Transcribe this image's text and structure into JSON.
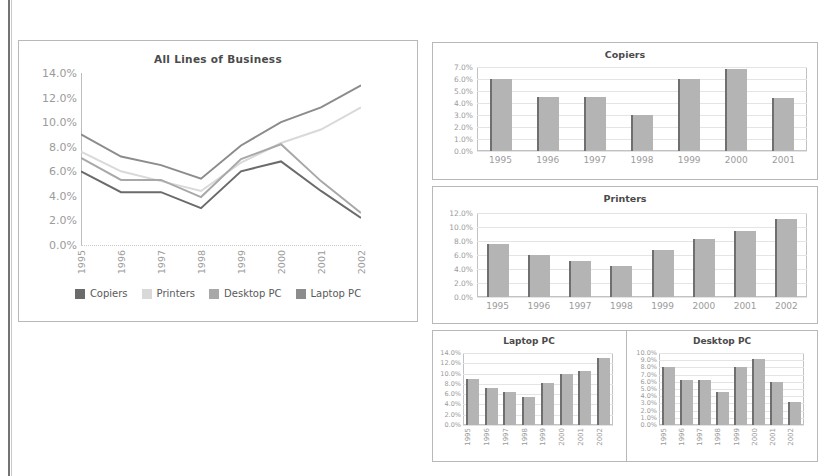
{
  "document": {
    "background_color": "#ffffff",
    "page_edge_color": "#5b5b5b"
  },
  "palette": {
    "copiers": "#6b6b6b",
    "printers": "#d9d9d9",
    "desktop_pc": "#a8a8a8",
    "laptop_pc": "#8c8c8c",
    "bar_fill": "#b4b4b4",
    "bar_edge": "#6f6f6f",
    "grid": "#e4e4e4",
    "axis": "#bdbdbd",
    "panel_border": "#b8b8b8",
    "tick_text": "#9b9b9b",
    "title_text": "#4a4a4a"
  },
  "line_chart": {
    "title": "All Lines of Business",
    "legend": [
      {
        "label": "Copiers",
        "color": "#6b6b6b"
      },
      {
        "label": "Printers",
        "color": "#d9d9d9"
      },
      {
        "label": "Desktop PC",
        "color": "#a8a8a8"
      },
      {
        "label": "Laptop PC",
        "color": "#8c8c8c"
      }
    ]
  },
  "chart_data": [
    {
      "id": "all-lines-of-business",
      "type": "line",
      "title": "All Lines of Business",
      "xlabel": "",
      "ylabel": "",
      "x": [
        "1995",
        "1996",
        "1997",
        "1998",
        "1999",
        "2000",
        "2001",
        "2002"
      ],
      "yticks": [
        "0.0%",
        "2.0%",
        "4.0%",
        "6.0%",
        "8.0%",
        "10.0%",
        "12.0%",
        "14.0%"
      ],
      "ylim": [
        0,
        14
      ],
      "grid": false,
      "legend_position": "bottom",
      "series": [
        {
          "name": "Copiers",
          "color": "#6b6b6b",
          "values": [
            6.0,
            4.3,
            4.3,
            3.0,
            6.0,
            6.8,
            4.4,
            2.2
          ]
        },
        {
          "name": "Printers",
          "color": "#d9d9d9",
          "values": [
            7.6,
            6.0,
            5.2,
            4.4,
            6.7,
            8.3,
            9.4,
            11.2
          ]
        },
        {
          "name": "Desktop PC",
          "color": "#a8a8a8",
          "values": [
            7.1,
            5.3,
            5.3,
            3.9,
            7.0,
            8.2,
            5.2,
            2.6
          ]
        },
        {
          "name": "Laptop PC",
          "color": "#8c8c8c",
          "values": [
            9.0,
            7.2,
            6.5,
            5.4,
            8.1,
            10.0,
            11.2,
            13.0
          ]
        }
      ]
    },
    {
      "id": "copiers",
      "type": "bar",
      "title": "Copiers",
      "xlabel": "",
      "ylabel": "",
      "categories": [
        "1995",
        "1996",
        "1997",
        "1998",
        "1999",
        "2000",
        "2001"
      ],
      "values": [
        6.0,
        4.5,
        4.5,
        3.0,
        6.0,
        6.8,
        4.4
      ],
      "yticks": [
        "0.0%",
        "1.0%",
        "2.0%",
        "3.0%",
        "4.0%",
        "5.0%",
        "6.0%",
        "7.0%"
      ],
      "ylim": [
        0,
        7
      ],
      "grid": true
    },
    {
      "id": "printers",
      "type": "bar",
      "title": "Printers",
      "xlabel": "",
      "ylabel": "",
      "categories": [
        "1995",
        "1996",
        "1997",
        "1998",
        "1999",
        "2000",
        "2001",
        "2002"
      ],
      "values": [
        7.6,
        6.0,
        5.2,
        4.4,
        6.7,
        8.3,
        9.4,
        11.2
      ],
      "yticks": [
        "0.0%",
        "2.0%",
        "4.0%",
        "6.0%",
        "8.0%",
        "10.0%",
        "12.0%"
      ],
      "ylim": [
        0,
        12
      ],
      "grid": true
    },
    {
      "id": "laptop-pc",
      "type": "bar",
      "title": "Laptop PC",
      "xlabel": "",
      "ylabel": "",
      "categories": [
        "1995",
        "1996",
        "1997",
        "1998",
        "1999",
        "2000",
        "2001",
        "2002"
      ],
      "values": [
        9.0,
        7.2,
        6.5,
        5.4,
        8.1,
        10.0,
        10.6,
        13.0
      ],
      "yticks": [
        "0.0%",
        "2.0%",
        "4.0%",
        "6.0%",
        "8.0%",
        "10.0%",
        "12.0%",
        "14.0%"
      ],
      "ylim": [
        0,
        14
      ],
      "grid": true
    },
    {
      "id": "desktop-pc",
      "type": "bar",
      "title": "Desktop PC",
      "xlabel": "",
      "ylabel": "",
      "categories": [
        "1995",
        "1996",
        "1997",
        "1998",
        "1999",
        "2000",
        "2001",
        "2002"
      ],
      "values": [
        8.0,
        6.2,
        6.2,
        4.6,
        8.0,
        9.2,
        6.0,
        3.2
      ],
      "yticks": [
        "0.0%",
        "1.0%",
        "2.0%",
        "3.0%",
        "4.0%",
        "5.0%",
        "6.0%",
        "7.0%",
        "8.0%",
        "9.0%",
        "10.0%"
      ],
      "ylim": [
        0,
        10
      ],
      "grid": true
    }
  ]
}
